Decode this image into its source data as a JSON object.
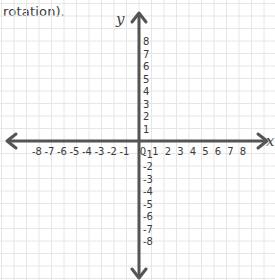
{
  "caption": "rotation).",
  "plane": {
    "x_axis_label": "x",
    "y_axis_label": "y",
    "x_ticks": [
      "-8",
      "-7",
      "-6",
      "-5",
      "-4",
      "-3",
      "-2",
      "-1",
      "0",
      "1",
      "2",
      "3",
      "4",
      "5",
      "6",
      "7",
      "8"
    ],
    "y_ticks": [
      "8",
      "7",
      "6",
      "5",
      "4",
      "3",
      "2",
      "1",
      "-1",
      "-2",
      "-3",
      "-4",
      "-5",
      "-6",
      "-7",
      "-8"
    ],
    "range": {
      "x": [
        -8,
        8
      ],
      "y": [
        -8,
        8
      ]
    },
    "grid": true
  },
  "colors": {
    "axis": "#555555",
    "grid": "#e6e6e6",
    "text": "#3a3a3a"
  }
}
